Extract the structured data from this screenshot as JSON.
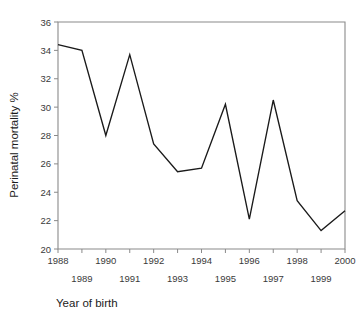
{
  "chart_data": {
    "type": "line",
    "title": "",
    "xlabel": "Year of birth",
    "ylabel": "Perinatal mortality %",
    "x": [
      1988,
      1989,
      1990,
      1991,
      1992,
      1993,
      1994,
      1995,
      1996,
      1997,
      1998,
      1999,
      2000
    ],
    "values": [
      34.4,
      34.0,
      28.0,
      33.7,
      27.4,
      25.45,
      25.7,
      30.2,
      22.1,
      30.5,
      23.4,
      21.3,
      22.7
    ],
    "series": [
      {
        "name": "Perinatal mortality",
        "values": [
          34.4,
          34.0,
          28.0,
          33.7,
          27.4,
          25.45,
          25.7,
          30.2,
          22.1,
          30.5,
          23.4,
          21.3,
          22.7
        ]
      }
    ],
    "xlim": [
      1988,
      2000
    ],
    "ylim": [
      20,
      36
    ],
    "ytick_labels": [
      "36",
      "34",
      "32",
      "30",
      "28",
      "26",
      "24",
      "22",
      "20"
    ],
    "ytick_values": [
      36,
      34,
      32,
      30,
      28,
      26,
      24,
      22,
      20
    ],
    "xtick_values": [
      1988,
      1989,
      1990,
      1991,
      1992,
      1993,
      1994,
      1995,
      1996,
      1997,
      1998,
      1999,
      2000
    ],
    "xtick_labels_upper": [
      "1988",
      "1990",
      "1992",
      "1994",
      "1996",
      "1998",
      "2000"
    ],
    "xtick_labels_lower": [
      "1989",
      "1991",
      "1993",
      "1995",
      "1997",
      "1999"
    ],
    "grid": false,
    "legend": null,
    "line_color": "#1a1a1a",
    "axis_color": "#8a8a8a"
  }
}
